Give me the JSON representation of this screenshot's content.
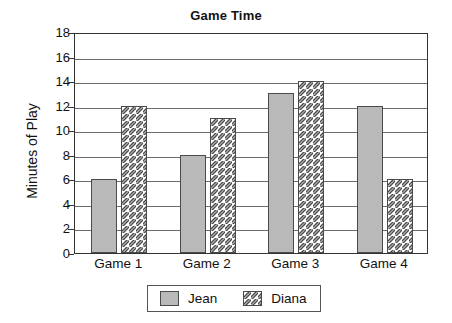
{
  "chart_data": {
    "type": "bar",
    "title": "Game Time",
    "xlabel": "",
    "ylabel": "Minutes of Play",
    "categories": [
      "Game 1",
      "Game 2",
      "Game 3",
      "Game 4"
    ],
    "series": [
      {
        "name": "Jean",
        "values": [
          6,
          8,
          13,
          12
        ],
        "fill": "#b9b9b9",
        "pattern": "solid"
      },
      {
        "name": "Diana",
        "values": [
          12,
          11,
          14,
          6
        ],
        "fill": "#ffffff",
        "pattern": "diagonal-hatch"
      }
    ],
    "ylim": [
      0,
      18
    ],
    "ytick_step": 2,
    "yticks": [
      18,
      16,
      14,
      12,
      10,
      8,
      6,
      4,
      2,
      0
    ],
    "grid": true,
    "grid_axis": "y",
    "legend_position": "bottom-center",
    "axis_color": "#333333",
    "grid_color": "#6b6b6b",
    "background": "#ffffff"
  }
}
